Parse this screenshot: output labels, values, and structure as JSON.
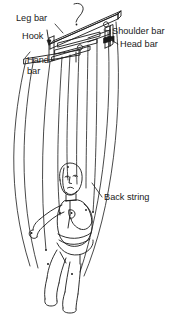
{
  "diagram": {
    "stroke_color": "#1a1a1a",
    "background_color": "#ffffff",
    "labels": [
      {
        "id": "leg-bar",
        "text": "Leg bar",
        "x": 16,
        "y": 21
      },
      {
        "id": "hook",
        "text": "Hook",
        "x": 22,
        "y": 39
      },
      {
        "id": "hand-bar-1",
        "text": "Hand",
        "x": 27,
        "y": 63
      },
      {
        "id": "hand-bar-2",
        "text": "bar",
        "x": 27,
        "y": 74
      },
      {
        "id": "shoulder-bar",
        "text": "Shoulder bar",
        "x": 112,
        "y": 34
      },
      {
        "id": "head-bar",
        "text": "Head bar",
        "x": 120,
        "y": 47
      },
      {
        "id": "back-string",
        "text": "Back string",
        "x": 104,
        "y": 200
      }
    ],
    "parts": [
      {
        "id": "leg-bar",
        "name": "Leg bar"
      },
      {
        "id": "hook",
        "name": "Hook"
      },
      {
        "id": "hand-bar",
        "name": "Hand bar"
      },
      {
        "id": "shoulder-bar",
        "name": "Shoulder bar"
      },
      {
        "id": "head-bar",
        "name": "Head bar"
      },
      {
        "id": "back-string",
        "name": "Back string"
      },
      {
        "id": "puppet",
        "name": "Puppet figure"
      }
    ]
  }
}
